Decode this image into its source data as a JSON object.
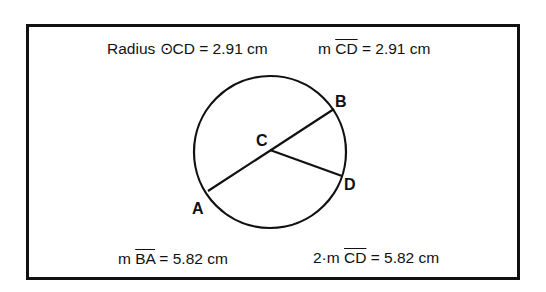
{
  "measurements": {
    "radius": {
      "prefix": "Radius ",
      "symbol": "⊙",
      "name": "CD",
      "value": " = 2.91 cm"
    },
    "cd_length": {
      "prefix": "m ",
      "segment": "CD",
      "value": " = 2.91 cm"
    },
    "ba_length": {
      "prefix": "m ",
      "segment": "BA",
      "value": " = 5.82 cm"
    },
    "double_cd": {
      "prefix": "2·m ",
      "segment": "CD",
      "value": " = 5.82 cm"
    }
  },
  "points": {
    "A": "A",
    "B": "B",
    "C": "C",
    "D": "D"
  },
  "colors": {
    "stroke": "#111111",
    "background": "#ffffff"
  }
}
